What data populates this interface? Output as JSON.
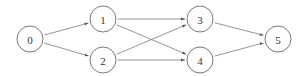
{
  "diagram": {
    "type": "directed-graph",
    "nodes": [
      {
        "id": "0",
        "label": "0",
        "x": 30,
        "y": 39
      },
      {
        "id": "1",
        "label": "1",
        "x": 103,
        "y": 19
      },
      {
        "id": "2",
        "label": "2",
        "x": 103,
        "y": 60
      },
      {
        "id": "3",
        "label": "3",
        "x": 200,
        "y": 19
      },
      {
        "id": "4",
        "label": "4",
        "x": 200,
        "y": 60
      },
      {
        "id": "5",
        "label": "5",
        "x": 278,
        "y": 39
      }
    ],
    "edges": [
      {
        "from": "0",
        "to": "1"
      },
      {
        "from": "0",
        "to": "2"
      },
      {
        "from": "1",
        "to": "3"
      },
      {
        "from": "1",
        "to": "4"
      },
      {
        "from": "2",
        "to": "3"
      },
      {
        "from": "2",
        "to": "4"
      },
      {
        "from": "3",
        "to": "5"
      },
      {
        "from": "4",
        "to": "5"
      }
    ],
    "node_radius": 13,
    "colors": {
      "stroke": "#6a6a6a",
      "edge": "#7a7a7a",
      "text": "#333333",
      "background": "#ffffff"
    }
  }
}
